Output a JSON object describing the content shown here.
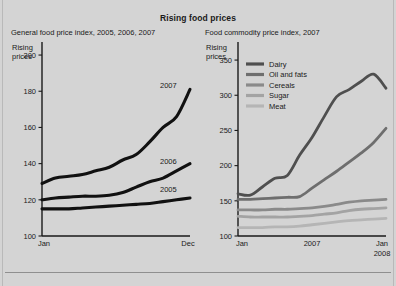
{
  "figure": {
    "title": "Rising food prices",
    "background_color": "#d4d4d4",
    "axis_label_text": "Rising\nprices",
    "axis_label_line1": "Rising",
    "axis_label_line2": "prices"
  },
  "left_panel": {
    "subtitle": "General food price index, 2005, 2006, 2007",
    "axis_note_line1": "Rising",
    "axis_note_line2": "prices",
    "series_labels": [
      "2007",
      "2006",
      "2005"
    ]
  },
  "right_panel": {
    "subtitle": "Food commodity price index, 2007",
    "axis_note_line1": "Rising",
    "axis_note_line2": "prices",
    "legend": [
      {
        "label": "Dairy",
        "color": "#4f4f4f"
      },
      {
        "label": "Oil and fats",
        "color": "#6e6e6e"
      },
      {
        "label": "Cereals",
        "color": "#8a8a8a"
      },
      {
        "label": "Sugar",
        "color": "#a3a3a3"
      },
      {
        "label": "Meat",
        "color": "#b5b5b5"
      }
    ]
  },
  "chart_data": [
    {
      "type": "line",
      "id": "general-food-price-index",
      "title": "General food price index, 2005, 2006, 2007",
      "xlabel": "",
      "ylabel": "Rising prices",
      "xlim": [
        0,
        11
      ],
      "ylim": [
        100,
        205
      ],
      "yticks": [
        100,
        120,
        140,
        160,
        180,
        200
      ],
      "ytick_labels": [
        "100",
        "120",
        "140",
        "160",
        "180",
        "200"
      ],
      "xtick_labels": [
        "Jan",
        "Dec"
      ],
      "grid": false,
      "legend_position": "inline-right-of-line",
      "x": [
        "Jan",
        "Feb",
        "Mar",
        "Apr",
        "May",
        "Jun",
        "Jul",
        "Aug",
        "Sep",
        "Oct",
        "Nov",
        "Dec"
      ],
      "series": [
        {
          "name": "2005",
          "color": "#111111",
          "values": [
            115,
            115,
            115,
            115.5,
            116,
            116.5,
            117,
            117.5,
            118,
            119,
            120,
            121
          ]
        },
        {
          "name": "2006",
          "color": "#111111",
          "values": [
            120,
            121,
            121.5,
            122,
            122,
            122.5,
            124,
            127,
            130,
            132,
            136,
            140
          ]
        },
        {
          "name": "2007",
          "color": "#111111",
          "values": [
            129,
            132,
            133,
            134,
            136,
            138,
            142,
            145,
            152,
            160,
            166,
            181
          ]
        }
      ]
    },
    {
      "type": "line",
      "id": "food-commodity-price-index-2007",
      "title": "Food commodity price index, 2007",
      "xlabel": "",
      "ylabel": "Rising prices",
      "xlim": [
        0,
        12
      ],
      "ylim": [
        100,
        370
      ],
      "yticks": [
        100,
        150,
        200,
        250,
        300,
        350
      ],
      "ytick_labels": [
        "100",
        "150",
        "200",
        "250",
        "300",
        "350"
      ],
      "xtick_labels": [
        "Jan",
        "2007",
        "Jan",
        "2008"
      ],
      "grid": false,
      "legend_position": "top-left-inside",
      "x": [
        "Jan",
        "Feb",
        "Mar",
        "Apr",
        "May",
        "Jun",
        "Jul",
        "Aug",
        "Sep",
        "Oct",
        "Nov",
        "Dec",
        "Jan"
      ],
      "series": [
        {
          "name": "Dairy",
          "color": "#4f4f4f",
          "values": [
            160,
            158,
            170,
            182,
            186,
            215,
            240,
            270,
            298,
            308,
            320,
            330,
            310
          ]
        },
        {
          "name": "Oil and fats",
          "color": "#6e6e6e",
          "values": [
            152,
            152,
            153,
            154,
            155,
            156,
            168,
            180,
            192,
            205,
            218,
            233,
            253
          ]
        },
        {
          "name": "Cereals",
          "color": "#8a8a8a",
          "values": [
            137,
            137,
            137,
            138,
            138,
            139,
            140,
            142,
            145,
            148,
            150,
            151,
            152
          ]
        },
        {
          "name": "Sugar",
          "color": "#a3a3a3",
          "values": [
            128,
            127,
            127,
            127,
            127,
            128,
            129,
            131,
            133,
            136,
            138,
            139,
            140
          ]
        },
        {
          "name": "Meat",
          "color": "#b5b5b5",
          "values": [
            112,
            112,
            112,
            113,
            113,
            114,
            116,
            118,
            120,
            122,
            123,
            124,
            125
          ]
        }
      ]
    }
  ]
}
